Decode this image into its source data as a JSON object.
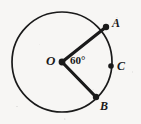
{
  "figure": {
    "kind": "geometry-diagram",
    "background_color": "#f7f6f4",
    "stroke_color": "#1a1a1a",
    "labels": {
      "center": "O",
      "point_a": "A",
      "point_b": "B",
      "point_c": "C",
      "angle": "60°"
    },
    "geometry": {
      "center": {
        "x": 62,
        "y": 62
      },
      "radius": 50,
      "circle_stroke_width": 1.7,
      "radius_stroke_width": 3.2,
      "points": [
        {
          "name": "A",
          "x": 106,
          "y": 27,
          "dot_radius": 3.2,
          "on_circle": true
        },
        {
          "name": "B",
          "x": 96,
          "y": 97,
          "dot_radius": 3.2,
          "on_circle": true
        },
        {
          "name": "C",
          "x": 111,
          "y": 66,
          "dot_radius": 2.8,
          "on_circle": true
        },
        {
          "name": "O",
          "x": 62,
          "y": 62,
          "dot_radius": 3.4,
          "on_circle": false
        }
      ],
      "segments": [
        {
          "name": "OA",
          "from": "O",
          "to": "A"
        },
        {
          "name": "OB",
          "from": "O",
          "to": "B"
        }
      ],
      "central_angle_degrees": 60
    },
    "label_positions": {
      "O": {
        "x": 46,
        "y": 54
      },
      "A": {
        "x": 112,
        "y": 17
      },
      "B": {
        "x": 100,
        "y": 100
      },
      "C": {
        "x": 117,
        "y": 60
      },
      "angle": {
        "x": 70,
        "y": 55
      }
    }
  }
}
